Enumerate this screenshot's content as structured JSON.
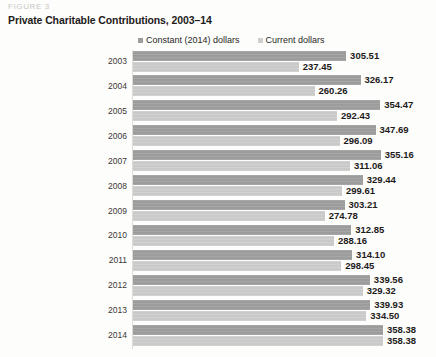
{
  "figure_label": "FIGURE 3",
  "title": "Private Charitable Contributions, 2003–14",
  "legend": {
    "items": [
      {
        "label": "Constant (2014) dollars",
        "color": "#9d9d9d",
        "key": "constant"
      },
      {
        "label": "Current dollars",
        "color": "#cfcfcf",
        "key": "current"
      }
    ]
  },
  "chart_data": {
    "type": "bar",
    "orientation": "horizontal",
    "title": "Private Charitable Contributions, 2003–14",
    "xlabel": "",
    "ylabel": "",
    "grid": false,
    "legend_position": "top",
    "xlim": [
      0,
      358.38
    ],
    "categories": [
      "2003",
      "2004",
      "2005",
      "2006",
      "2007",
      "2008",
      "2009",
      "2010",
      "2011",
      "2012",
      "2013",
      "2014"
    ],
    "series": [
      {
        "name": "Constant (2014) dollars",
        "color": "#9d9d9d",
        "values": [
          305.51,
          326.17,
          354.47,
          347.69,
          355.16,
          329.44,
          303.21,
          312.85,
          314.1,
          339.56,
          339.93,
          358.38
        ],
        "labels": [
          "305.51",
          "326.17",
          "354.47",
          "347.69",
          "355.16",
          "329.44",
          "303.21",
          "312.85",
          "314.10",
          "339.56",
          "339.93",
          "358.38"
        ]
      },
      {
        "name": "Current dollars",
        "color": "#cfcfcf",
        "values": [
          237.45,
          260.26,
          292.43,
          296.09,
          311.06,
          299.61,
          274.78,
          288.16,
          298.45,
          329.32,
          334.5,
          358.38
        ],
        "labels": [
          "237.45",
          "260.26",
          "292.43",
          "296.09",
          "311.06",
          "299.61",
          "274.78",
          "288.16",
          "298.45",
          "329.32",
          "334.50",
          "358.38"
        ]
      }
    ]
  }
}
